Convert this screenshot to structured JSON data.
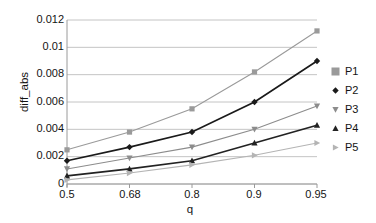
{
  "chart_data": {
    "type": "line",
    "title": "",
    "xlabel": "q",
    "ylabel": "diff_abs",
    "categories": [
      "0.5",
      "0.68",
      "0.8",
      "0.9",
      "0.95"
    ],
    "x_tick_labels": [
      "0.5",
      "0.68",
      "0.8",
      "0.9",
      "0.95"
    ],
    "y_tick_labels": [
      "0",
      "0.002",
      "0.004",
      "0.006",
      "0.008",
      "0.01",
      "0.012"
    ],
    "y_tick_values": [
      0,
      0.002,
      0.004,
      0.006,
      0.008,
      0.01,
      0.012
    ],
    "ylim": [
      0,
      0.012
    ],
    "grid": "horizontal",
    "legend_position": "right",
    "series": [
      {
        "name": "P1",
        "marker": "square",
        "color": "#9a9a9a",
        "values": [
          0.0025,
          0.0038,
          0.0055,
          0.0082,
          0.0112
        ]
      },
      {
        "name": "P2",
        "marker": "diamond",
        "color": "#1a1a1a",
        "values": [
          0.0017,
          0.0027,
          0.0038,
          0.006,
          0.009
        ]
      },
      {
        "name": "P3",
        "marker": "triangle-down",
        "color": "#8c8c8c",
        "values": [
          0.0011,
          0.0019,
          0.0027,
          0.004,
          0.0057
        ]
      },
      {
        "name": "P4",
        "marker": "triangle-up",
        "color": "#222222",
        "values": [
          0.0006,
          0.0011,
          0.0017,
          0.003,
          0.0043
        ]
      },
      {
        "name": "P5",
        "marker": "triangle-right",
        "color": "#b4b4b4",
        "values": [
          0.0003,
          0.0008,
          0.0014,
          0.0021,
          0.003
        ]
      }
    ]
  },
  "legend": {
    "items": [
      {
        "label": "P1"
      },
      {
        "label": "P2"
      },
      {
        "label": "P3"
      },
      {
        "label": "P4"
      },
      {
        "label": "P5"
      }
    ]
  }
}
